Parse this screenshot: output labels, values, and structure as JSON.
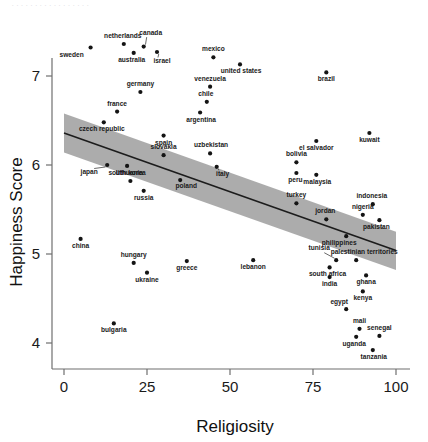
{
  "top_fragment": "     . . . . . . . .   . . . . . .    . . .",
  "chart_data": {
    "type": "scatter",
    "title": "",
    "xlabel": "Religiosity",
    "ylabel": "Happiness Score",
    "xlim": [
      -4,
      104
    ],
    "ylim": [
      3.62,
      7.55
    ],
    "xticks": [
      0,
      25,
      50,
      75,
      100
    ],
    "yticks": [
      4,
      5,
      6,
      7
    ],
    "grid": false,
    "legend": null,
    "regression": {
      "type": "linear-fit-with-confidence-band",
      "line_color": "#1c1c1c",
      "band_color": "#a8a8a8",
      "x_start": 0,
      "x_end": 100,
      "y_start": 6.36,
      "y_end": 5.04,
      "band_upper_start": 6.58,
      "band_lower_start": 6.14,
      "band_upper_end": 5.25,
      "band_lower_end": 4.82
    },
    "points": [
      {
        "label": "sweden",
        "x": 8,
        "y": 7.32,
        "lx": -19,
        "ly": 9
      },
      {
        "label": "netherlands",
        "x": 18,
        "y": 7.36,
        "lx": -1,
        "ly": -6
      },
      {
        "label": "canada",
        "x": 24,
        "y": 7.33,
        "lx": 7,
        "ly": -12,
        "leader": true
      },
      {
        "label": "australia",
        "x": 21,
        "y": 7.26,
        "lx": -2,
        "ly": 9
      },
      {
        "label": "israel",
        "x": 28,
        "y": 7.27,
        "lx": 5,
        "ly": 11,
        "leader": true
      },
      {
        "label": "mexico",
        "x": 45,
        "y": 7.21,
        "lx": 0,
        "ly": -6
      },
      {
        "label": "united states",
        "x": 53,
        "y": 7.13,
        "lx": 1,
        "ly": 9
      },
      {
        "label": "brazil",
        "x": 79,
        "y": 7.04,
        "lx": 0,
        "ly": 9
      },
      {
        "label": "germany",
        "x": 23,
        "y": 6.82,
        "lx": 0,
        "ly": -6
      },
      {
        "label": "venezuela",
        "x": 44,
        "y": 6.88,
        "lx": 0,
        "ly": -6
      },
      {
        "label": "chile",
        "x": 43,
        "y": 6.71,
        "lx": -1,
        "ly": -6
      },
      {
        "label": "france",
        "x": 16,
        "y": 6.6,
        "lx": 0,
        "ly": -6
      },
      {
        "label": "argentina",
        "x": 41,
        "y": 6.59,
        "lx": 1,
        "ly": 9
      },
      {
        "label": "czech republic",
        "x": 12,
        "y": 6.48,
        "lx": -2,
        "ly": 9
      },
      {
        "label": "spain",
        "x": 30,
        "y": 6.33,
        "lx": 0,
        "ly": 9
      },
      {
        "label": "kuwait",
        "x": 92,
        "y": 6.36,
        "lx": 0,
        "ly": 9
      },
      {
        "label": "el salvador",
        "x": 76,
        "y": 6.27,
        "lx": 0,
        "ly": 9
      },
      {
        "label": "slovakia",
        "x": 30,
        "y": 6.11,
        "lx": 0,
        "ly": -6
      },
      {
        "label": "uzbekistan",
        "x": 44,
        "y": 6.13,
        "lx": 1,
        "ly": -6
      },
      {
        "label": "japan",
        "x": 13,
        "y": 6.0,
        "lx": -18,
        "ly": 9,
        "leader": true
      },
      {
        "label": "south korea",
        "x": 19,
        "y": 5.99,
        "lx": 0,
        "ly": 9
      },
      {
        "label": "italy",
        "x": 46,
        "y": 5.98,
        "lx": 6,
        "ly": 9,
        "leader": true
      },
      {
        "label": "bolivia",
        "x": 70,
        "y": 6.03,
        "lx": 0,
        "ly": -6
      },
      {
        "label": "peru",
        "x": 70,
        "y": 5.91,
        "lx": -1,
        "ly": 9
      },
      {
        "label": "malaysia",
        "x": 76,
        "y": 5.89,
        "lx": 1,
        "ly": 9
      },
      {
        "label": "lithuania",
        "x": 20,
        "y": 5.82,
        "lx": -1,
        "ly": -6
      },
      {
        "label": "poland",
        "x": 35,
        "y": 5.83,
        "lx": 6,
        "ly": 8
      },
      {
        "label": "russia",
        "x": 24,
        "y": 5.71,
        "lx": 0,
        "ly": 9
      },
      {
        "label": "indonesia",
        "x": 93,
        "y": 5.56,
        "lx": -1,
        "ly": -6
      },
      {
        "label": "turkey",
        "x": 70,
        "y": 5.57,
        "lx": 0,
        "ly": -6
      },
      {
        "label": "nigeria",
        "x": 90,
        "y": 5.44,
        "lx": 0,
        "ly": -6
      },
      {
        "label": "jordan",
        "x": 79,
        "y": 5.39,
        "lx": -1,
        "ly": -6
      },
      {
        "label": "pakistan",
        "x": 95,
        "y": 5.38,
        "lx": -3,
        "ly": 9
      },
      {
        "label": "china",
        "x": 5,
        "y": 5.17,
        "lx": 0,
        "ly": 9
      },
      {
        "label": "philippines",
        "x": 85,
        "y": 5.2,
        "lx": -7,
        "ly": 9
      },
      {
        "label": "tunisia",
        "x": 82,
        "y": 4.93,
        "lx": -17,
        "ly": -10,
        "leader": true
      },
      {
        "label": "palestinian territories",
        "x": 88,
        "y": 4.93,
        "lx": 8,
        "ly": -6
      },
      {
        "label": "hungary",
        "x": 21,
        "y": 4.9,
        "lx": 0,
        "ly": -6
      },
      {
        "label": "greece",
        "x": 37,
        "y": 4.92,
        "lx": 0,
        "ly": 9
      },
      {
        "label": "lebanon",
        "x": 57,
        "y": 4.93,
        "lx": 0,
        "ly": 9
      },
      {
        "label": "south africa",
        "x": 80,
        "y": 4.85,
        "lx": -2,
        "ly": 9
      },
      {
        "label": "ukraine",
        "x": 25,
        "y": 4.79,
        "lx": 0,
        "ly": 9
      },
      {
        "label": "india",
        "x": 80,
        "y": 4.74,
        "lx": 0,
        "ly": 9
      },
      {
        "label": "ghana",
        "x": 91,
        "y": 4.76,
        "lx": 0,
        "ly": 9
      },
      {
        "label": "kenya",
        "x": 90,
        "y": 4.58,
        "lx": 0,
        "ly": 9
      },
      {
        "label": "egypt",
        "x": 85,
        "y": 4.38,
        "lx": -7,
        "ly": -5
      },
      {
        "label": "bulgaria",
        "x": 15,
        "y": 4.22,
        "lx": 0,
        "ly": 9
      },
      {
        "label": "mali",
        "x": 89,
        "y": 4.16,
        "lx": 0,
        "ly": -6
      },
      {
        "label": "uganda",
        "x": 88,
        "y": 4.07,
        "lx": -2,
        "ly": 9
      },
      {
        "label": "senegal",
        "x": 95,
        "y": 4.08,
        "lx": 0,
        "ly": -6
      },
      {
        "label": "tanzania",
        "x": 93,
        "y": 3.92,
        "lx": 1,
        "ly": 9
      }
    ]
  }
}
